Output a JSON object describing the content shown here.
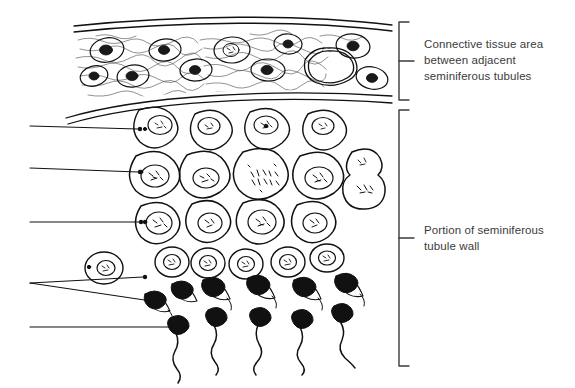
{
  "figure": {
    "title_present": false,
    "background_color": "#ffffff",
    "ink_color": "#111111",
    "text_color": "#3b3b3b"
  },
  "labels": {
    "connective": {
      "text": "Connective tissue area\nbetween adjacent\nseminiferous tubules",
      "bracket_top": 22,
      "bracket_bottom": 100
    },
    "tubule": {
      "text": "Portion of seminiferous\ntubule wall",
      "bracket_top": 110,
      "bracket_bottom": 366
    }
  },
  "brackets": [
    {
      "name": "connective-tissue-bracket",
      "x": 399,
      "y1": 22,
      "y2": 100,
      "tick_y": 61
    },
    {
      "name": "seminiferous-tubule-bracket",
      "x": 399,
      "y1": 110,
      "y2": 366,
      "tick_y": 238
    }
  ],
  "leaders": [
    {
      "name": "leader-spermatogonium",
      "x1": 30,
      "y1": 126,
      "x2": 139,
      "y2": 129
    },
    {
      "name": "leader-primary-spermatocyte",
      "x1": 30,
      "y1": 168,
      "x2": 139,
      "y2": 172
    },
    {
      "name": "leader-secondary-spermatocyte",
      "x1": 30,
      "y1": 222,
      "x2": 140,
      "y2": 222
    },
    {
      "name": "leader-spermatid",
      "x1": 30,
      "y1": 283,
      "x2": 145,
      "y2": 277
    },
    {
      "name": "leader-elongating-spermatid",
      "x1": 30,
      "y1": 283,
      "x2": 160,
      "y2": 302
    },
    {
      "name": "leader-spermatozoon",
      "x1": 30,
      "y1": 327,
      "x2": 170,
      "y2": 327
    }
  ],
  "regions": {
    "connective_tissue": {
      "name": "connective-tissue-region",
      "top_boundary_y": 18,
      "bottom_boundary_y": 98,
      "fibroblast_count": 11,
      "lumen_present": true
    },
    "tubule_wall": {
      "name": "seminiferous-tubule-wall-region",
      "rows": [
        {
          "name": "spermatogonia-row",
          "cell_count": 4,
          "cell_radius": 22
        },
        {
          "name": "primary-spermatocyte-row",
          "cell_count": 5,
          "cell_radius": 26
        },
        {
          "name": "secondary-spermatocyte-row",
          "cell_count": 5,
          "cell_radius": 22
        },
        {
          "name": "spermatid-row",
          "cell_count": 6,
          "cell_radius": 15
        },
        {
          "name": "elongating-spermatid-row",
          "cell_count": 6
        },
        {
          "name": "spermatozoa-row",
          "cell_count": 5
        }
      ],
      "dividing_cell_present": true
    }
  }
}
